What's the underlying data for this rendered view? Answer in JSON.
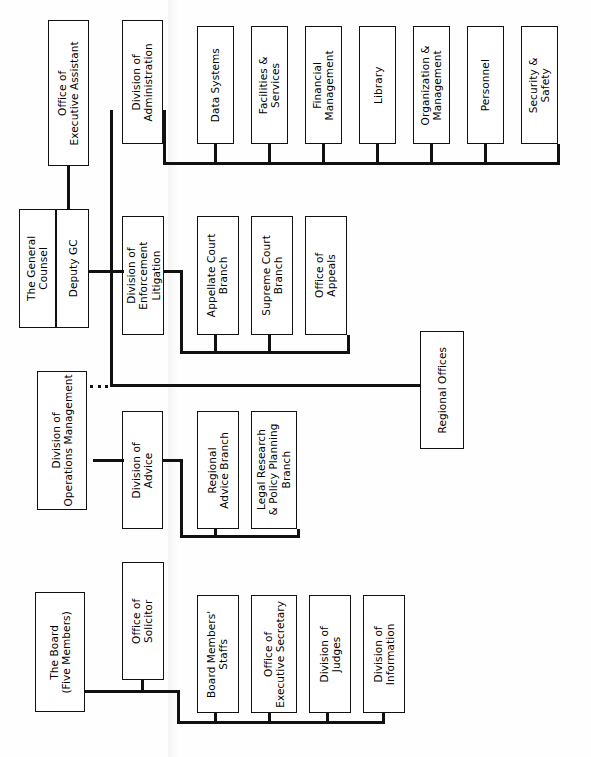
{
  "document": {
    "title": "National Labor Relations Board Organization Chart",
    "orientation": "rotated-90-ccw",
    "background_color": "#ffffff",
    "line_color": "#111111",
    "box_border_color": "#111111"
  },
  "nodes": {
    "office_executive_assistant": "Office of\nExecutive Assistant",
    "division_administration": "Division of\nAdministration",
    "data_systems": "Data Systems",
    "facilities_services": "Facilities &\nServices",
    "financial_management": "Financial\nManagement",
    "library": "Library",
    "organization_management": "Organization &\nManagement",
    "personnel": "Personnel",
    "security_safety": "Security &\nSafety",
    "the_general_counsel": "The General\nCounsel",
    "deputy_gc": "Deputy GC",
    "division_enforcement_litigation": "Division of\nEnforcement\nLitigation",
    "appellate_court_branch": "Appellate Court\nBranch",
    "supreme_court_branch": "Supreme Court\nBranch",
    "office_of_appeals": "Office of\nAppeals",
    "division_operations_management": "Division of\nOperations Management",
    "division_of_advice": "Division of\nAdvice",
    "regional_advice_branch": "Regional\nAdvice Branch",
    "legal_research_policy_planning_branch": "Legal Research\n& Policy Planning\nBranch",
    "regional_offices": "Regional Offices",
    "the_board": "The Board\n(Five Members)",
    "office_of_solicitor": "Office of\nSolicitor",
    "board_members_staffs": "Board Members'\nStaffs",
    "office_executive_secretary": "Office of\nExecutive Secretary",
    "division_of_judges": "Division of\nJudges",
    "division_of_information": "Division of\nInformation"
  },
  "groups": {
    "administration_children": [
      "Data Systems",
      "Facilities & Services",
      "Financial Management",
      "Library",
      "Organization & Management",
      "Personnel",
      "Security & Safety"
    ],
    "enforcement_litigation_children": [
      "Appellate Court Branch",
      "Supreme Court Branch",
      "Office of Appeals"
    ],
    "advice_children": [
      "Regional Advice Branch",
      "Legal Research & Policy Planning Branch"
    ],
    "board_children": [
      "Board Members' Staffs",
      "Office of Executive Secretary",
      "Division of Judges",
      "Division of Information"
    ]
  },
  "connector_dots": "•••"
}
